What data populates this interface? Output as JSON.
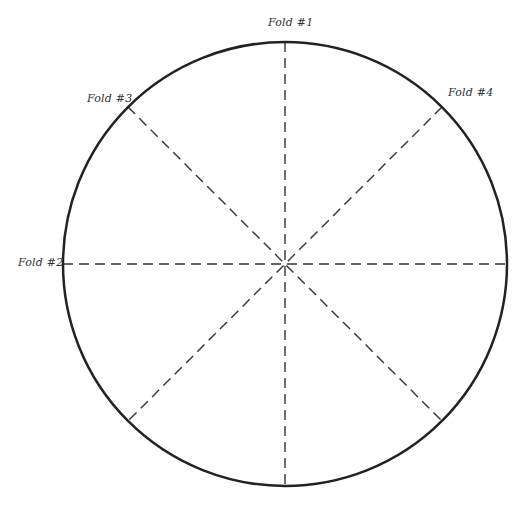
{
  "diagram": {
    "circle": {
      "cx": 285,
      "cy": 264,
      "r": 222,
      "stroke": "#222222",
      "stroke_width": 2.5
    },
    "fold_line_color": "#333333",
    "folds": [
      {
        "id": 1,
        "label": "Fold #1",
        "angle_deg": 90
      },
      {
        "id": 2,
        "label": "Fold #2",
        "angle_deg": 0
      },
      {
        "id": 3,
        "label": "Fold #3",
        "angle_deg": 135
      },
      {
        "id": 4,
        "label": "Fold #4",
        "angle_deg": 45
      }
    ]
  }
}
